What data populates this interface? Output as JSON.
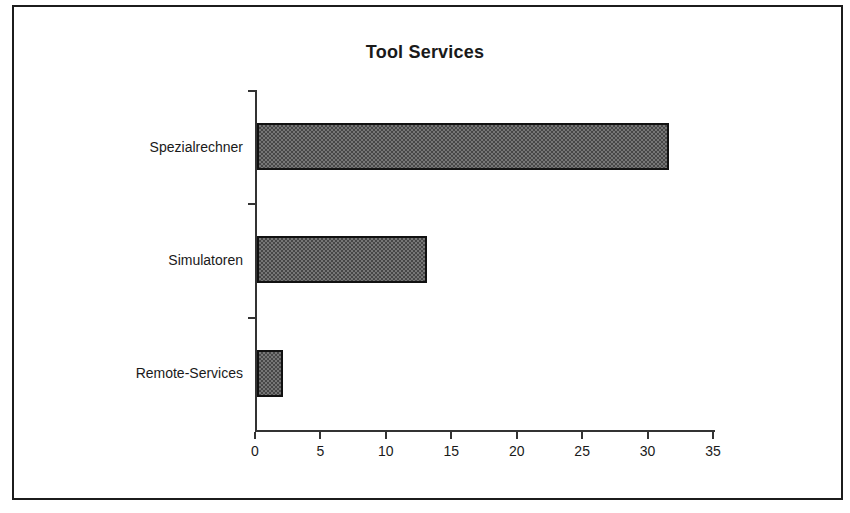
{
  "figure": {
    "background": "#ffffff",
    "frame_color": "#1c1c1c"
  },
  "chart_data": {
    "type": "bar",
    "orientation": "horizontal",
    "title": "Tool Services",
    "categories": [
      "Spezialrechner",
      "Simulatoren",
      "Remote-Services"
    ],
    "values": [
      31.5,
      13,
      2
    ],
    "xlabel": "",
    "ylabel": "",
    "xlim": [
      0,
      35
    ],
    "xticks": [
      0,
      5,
      10,
      15,
      20,
      25,
      30,
      35
    ],
    "grid": false,
    "legend": false,
    "bar_fill_pattern_colors": [
      "#474747",
      "#767676"
    ],
    "bar_border_color": "#111111",
    "axis_color": "#333333",
    "text_color": "#1a1a1a"
  }
}
